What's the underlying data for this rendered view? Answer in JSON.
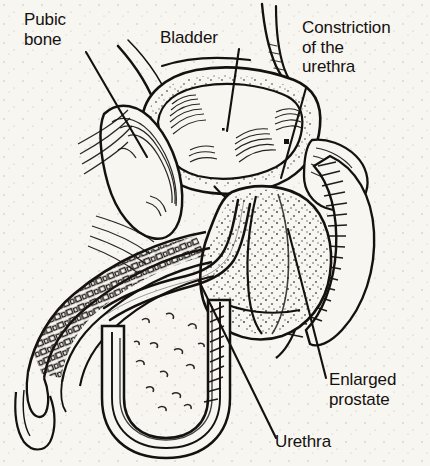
{
  "figure": {
    "background_color": "#f8f6f1",
    "ink_color": "#15110f",
    "width": 430,
    "height": 466,
    "style": "black-and-white pen-and-ink medical line drawing, sagittal section of male pelvis"
  },
  "labels": {
    "pubic_bone": "Pubic\nbone",
    "bladder": "Bladder",
    "constriction": "Constriction\nof the\nurethra",
    "enlarged_prostate": "Enlarged\nprostate",
    "urethra": "Urethra"
  },
  "leader_lines": [
    {
      "name": "pubic-bone-leader",
      "from": [
        86,
        52
      ],
      "to": [
        147,
        157
      ]
    },
    {
      "name": "bladder-leader",
      "from": [
        239,
        49
      ],
      "to": [
        227,
        131
      ]
    },
    {
      "name": "constriction-leader",
      "from": [
        306,
        88
      ],
      "to": [
        281,
        178
      ]
    },
    {
      "name": "enlarged-prostate-leader",
      "from": [
        326,
        378
      ],
      "to": [
        288,
        229
      ]
    },
    {
      "name": "urethra-leader",
      "from": [
        276,
        438
      ],
      "to": [
        199,
        281
      ]
    }
  ],
  "structures": [
    {
      "name": "bladder",
      "description": "rounded triangular sac, stippled wall, fan-hatched trabeculated interior"
    },
    {
      "name": "pubic-bone",
      "description": "elongated oblique oval with concentric contour lines"
    },
    {
      "name": "enlarged-prostate",
      "description": "stippled rounded mass beneath the bladder, compressing the urethra"
    },
    {
      "name": "urethra",
      "description": "narrow double-line channel curving from bladder neck through prostate down the penile shaft"
    },
    {
      "name": "penile-shaft",
      "description": "banded segmented corpus tissue running down-left"
    },
    {
      "name": "scrotum",
      "description": "U-shaped double-contour sac at lower left"
    },
    {
      "name": "rectum",
      "description": "hatch-shaded curving tube on the right margin"
    },
    {
      "name": "ureter",
      "description": "slim tube descending from the top into the bladder dome"
    }
  ]
}
